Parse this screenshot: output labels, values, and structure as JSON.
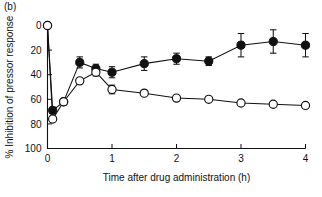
{
  "figure": {
    "panel_label": "(b)",
    "background": "#ffffff",
    "ink_color": "#111111"
  },
  "chart_data": {
    "type": "line",
    "title": "",
    "panel": "(b)",
    "xlabel": "Time after drug administration (h)",
    "ylabel": "% Inhibition of pressor response",
    "xlim": [
      0,
      4
    ],
    "ylim": [
      0,
      100
    ],
    "y_inverted": true,
    "grid": false,
    "legend_position": "none",
    "xticks": [
      0,
      1,
      2,
      3,
      4
    ],
    "xticklabels": [
      "0",
      "1",
      "2",
      "3",
      "4"
    ],
    "yticks": [
      0,
      20,
      40,
      60,
      80,
      100
    ],
    "yticklabels": [
      "0",
      "20",
      "40",
      "60",
      "80",
      "100"
    ],
    "x": [
      0,
      0.08,
      0.25,
      0.5,
      0.75,
      1.0,
      1.5,
      2.0,
      2.5,
      3.0,
      3.5,
      4.0
    ],
    "series": [
      {
        "name": "filled-circles",
        "marker": "filled-circle",
        "values": [
          0,
          69,
          62,
          30,
          35,
          38,
          31,
          27,
          29,
          16,
          13,
          16
        ],
        "errors": [
          0,
          2.5,
          2.5,
          4.5,
          3.5,
          4.5,
          5.5,
          4.5,
          3.5,
          9.5,
          9.5,
          9.5
        ]
      },
      {
        "name": "open-circles",
        "marker": "open-circle",
        "values": [
          0,
          76,
          62,
          45,
          38,
          52,
          55,
          59,
          60,
          63,
          64,
          65
        ],
        "errors": [
          0,
          2.0,
          1.5,
          2.0,
          3.0,
          3.5,
          1.5,
          1.5,
          1.5,
          1.0,
          1.0,
          1.5
        ]
      }
    ]
  }
}
